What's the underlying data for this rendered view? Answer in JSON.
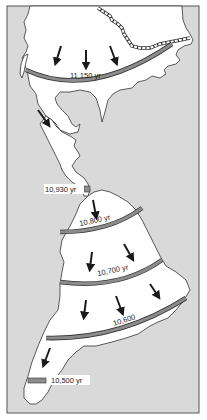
{
  "map": {
    "title": "",
    "colors": {
      "ocean": "#d9d9d9",
      "land": "#ffffff",
      "coastline": "#333333",
      "front_band": "#8c8c8c",
      "arrow": "#1a1a1a",
      "frame": "#555555"
    },
    "fronts": [
      {
        "id": "front-1",
        "label": "11,150 yr"
      },
      {
        "id": "front-2",
        "label": "10,930 yr"
      },
      {
        "id": "front-3",
        "label": "10,800 yr"
      },
      {
        "id": "front-4",
        "label": "10,700 yr"
      },
      {
        "id": "front-5",
        "label": "10,600"
      },
      {
        "id": "front-6",
        "label": "10,500 yr"
      }
    ],
    "arrows": {
      "icon": "arrow-down-icon",
      "count": 11,
      "meaning": "southward migration direction"
    }
  }
}
